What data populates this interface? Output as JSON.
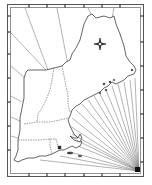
{
  "map": {
    "title": "",
    "region": "New England",
    "width": 152,
    "height": 185,
    "frame": {
      "outer": {
        "x": 7,
        "y": 4,
        "w": 136,
        "h": 172
      },
      "inner": {
        "x": 10,
        "y": 7,
        "w": 130,
        "h": 166
      },
      "ticks_top_x": [
        29,
        47,
        65,
        84,
        102,
        120
      ],
      "ticks_bottom_x": [
        29,
        47,
        65,
        84,
        102,
        120
      ],
      "ticks_left_y": [
        16,
        32,
        54,
        78,
        102,
        126,
        150
      ],
      "ticks_right_y": [
        16,
        42,
        66,
        90,
        114,
        138,
        162
      ]
    },
    "compass_rose": {
      "icon": "compass-rose-icon",
      "x": 100,
      "y": 44
    },
    "rhumb_hub": {
      "x": 139,
      "y": 171
    },
    "states": [
      "Maine",
      "New Hampshire",
      "Vermont",
      "Massachusetts",
      "Connecticut",
      "Rhode Island"
    ],
    "colors": {
      "background": "#ffffff",
      "outline": "#222222",
      "frame": "#555555",
      "rhumb_lines": "#666666"
    }
  }
}
